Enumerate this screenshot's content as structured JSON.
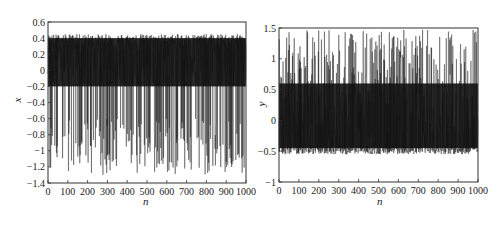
{
  "chart_data": [
    {
      "type": "line",
      "title": "",
      "xlabel": "n",
      "ylabel": "x",
      "xlim": [
        0,
        1000
      ],
      "ylim": [
        -1.4,
        0.6
      ],
      "xticks": [
        0,
        100,
        200,
        300,
        400,
        500,
        600,
        700,
        800,
        900,
        1000
      ],
      "xtick_labels": [
        "0",
        "100",
        "200",
        "300",
        "400",
        "500",
        "600",
        "700",
        "800",
        "900",
        "1000"
      ],
      "yticks": [
        0.6,
        0.4,
        0.2,
        0,
        -0.2,
        -0.4,
        -0.6,
        -0.8,
        -1,
        -1.2,
        -1.4
      ],
      "ytick_labels": [
        "0.6",
        "0.4",
        "0.2",
        "0",
        "-0.2",
        "-0.4",
        "-0.6",
        "-0.8",
        "-1",
        "-1.2",
        "-1.4"
      ],
      "grid": false,
      "legend": null,
      "series": [
        {
          "name": "x(n)",
          "n_points": 1000,
          "max_approx": 0.45,
          "min_approx": -1.3,
          "dense_band": [
            -0.2,
            0.4
          ],
          "description": "Chaotic sequence oscillating rapidly; upper envelope near 0.45, frequent downward spikes reaching -1.0 to -1.3"
        }
      ]
    },
    {
      "type": "line",
      "title": "",
      "xlabel": "n",
      "ylabel": "y",
      "xlim": [
        0,
        1000
      ],
      "ylim": [
        -1,
        1.5
      ],
      "xticks": [
        0,
        100,
        200,
        300,
        400,
        500,
        600,
        700,
        800,
        900,
        1000
      ],
      "xtick_labels": [
        "0",
        "100",
        "200",
        "300",
        "400",
        "500",
        "600",
        "700",
        "800",
        "900",
        "1000"
      ],
      "yticks": [
        1.5,
        1,
        0.5,
        0,
        -0.5,
        -1
      ],
      "ytick_labels": [
        "1.5",
        "1",
        "0.5",
        "0",
        "-0.5",
        "-1"
      ],
      "grid": false,
      "legend": null,
      "series": [
        {
          "name": "y(n)",
          "n_points": 1000,
          "max_approx": 1.48,
          "min_approx": -0.58,
          "dense_band": [
            -0.45,
            0.6
          ],
          "description": "Chaotic sequence oscillating rapidly; lower envelope near -0.55, frequent upward spikes reaching 1.0 to 1.48"
        }
      ]
    }
  ],
  "panels": {
    "left": {
      "xlabel": "n",
      "ylabel": "x"
    },
    "right": {
      "xlabel": "n",
      "ylabel": "y"
    }
  }
}
